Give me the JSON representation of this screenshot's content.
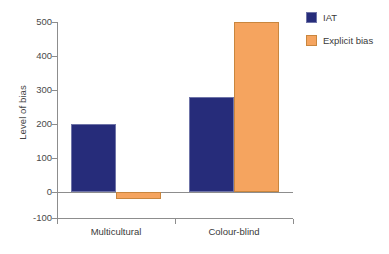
{
  "chart_data": {
    "type": "bar",
    "title": "",
    "subtitle": "",
    "xlabel": "",
    "ylabel": "Level of bias",
    "categories": [
      "Multicultural",
      "Colour-blind"
    ],
    "series": [
      {
        "name": "IAT",
        "color": "#262c7a",
        "values": [
          200,
          280
        ]
      },
      {
        "name": "Explicit bias",
        "color": "#f5a45f",
        "values": [
          -20,
          500
        ]
      }
    ],
    "ylim": [
      -100,
      500
    ],
    "ytick_labels": [
      "500",
      "400",
      "300",
      "200",
      "100",
      "0",
      "-100"
    ],
    "ytick_values": [
      500,
      400,
      300,
      200,
      100,
      0,
      -100
    ],
    "grid": false,
    "legend_position": "top-right",
    "annotations": []
  },
  "legend": {
    "entries": [
      {
        "label": "IAT",
        "color": "#262c7a"
      },
      {
        "label": "Explicit bias",
        "color": "#f5a45f"
      }
    ]
  },
  "axes": {
    "y_title": "Level of bias",
    "x_categories": [
      "Multicultural",
      "Colour-blind"
    ]
  },
  "colors": {
    "iat": "#262c7a",
    "explicit_bias": "#f5a45f",
    "axis": "#8d8d8d",
    "text": "#3a3a3a",
    "background": "#ffffff"
  }
}
